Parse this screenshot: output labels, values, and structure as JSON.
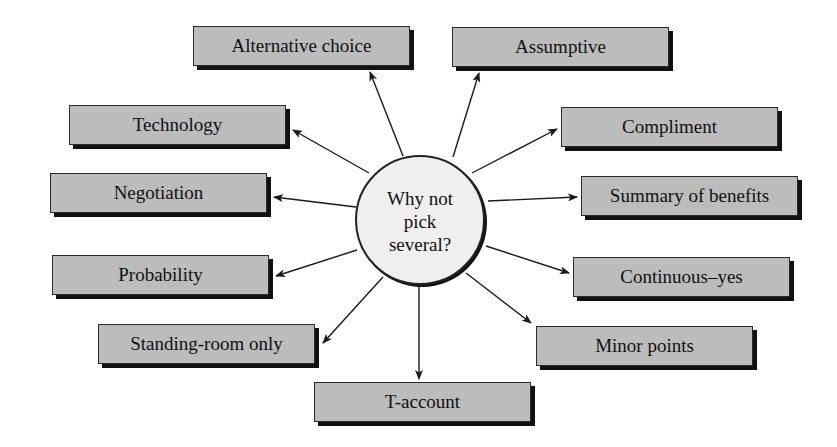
{
  "hub": {
    "label": "Why not\npick\nseveral?"
  },
  "nodes": [
    {
      "id": "alternative-choice",
      "label": "Alternative choice",
      "x": 193,
      "y": 26
    },
    {
      "id": "assumptive",
      "label": "Assumptive",
      "x": 452,
      "y": 27
    },
    {
      "id": "technology",
      "label": "Technology",
      "x": 69,
      "y": 105
    },
    {
      "id": "compliment",
      "label": "Compliment",
      "x": 561,
      "y": 107
    },
    {
      "id": "negotiation",
      "label": "Negotiation",
      "x": 50,
      "y": 173
    },
    {
      "id": "summary-of-benefits",
      "label": "Summary of benefits",
      "x": 581,
      "y": 176
    },
    {
      "id": "probability",
      "label": "Probability",
      "x": 52,
      "y": 255
    },
    {
      "id": "continuous-yes",
      "label": "Continuous–yes",
      "x": 573,
      "y": 257
    },
    {
      "id": "standing-room-only",
      "label": "Standing-room only",
      "x": 98,
      "y": 324
    },
    {
      "id": "minor-points",
      "label": "Minor points",
      "x": 536,
      "y": 326
    },
    {
      "id": "t-account",
      "label": "T-account",
      "x": 314,
      "y": 382
    }
  ],
  "arrows": [
    {
      "to": "alternative-choice",
      "x1": 403,
      "y1": 156,
      "x2": 370,
      "y2": 72
    },
    {
      "to": "assumptive",
      "x1": 453,
      "y1": 157,
      "x2": 479,
      "y2": 73
    },
    {
      "to": "technology",
      "x1": 369,
      "y1": 173,
      "x2": 293,
      "y2": 130
    },
    {
      "to": "compliment",
      "x1": 472,
      "y1": 173,
      "x2": 557,
      "y2": 129
    },
    {
      "to": "negotiation",
      "x1": 356,
      "y1": 207,
      "x2": 274,
      "y2": 197
    },
    {
      "to": "summary-of-benefits",
      "x1": 488,
      "y1": 201,
      "x2": 577,
      "y2": 197
    },
    {
      "to": "probability",
      "x1": 357,
      "y1": 250,
      "x2": 276,
      "y2": 276
    },
    {
      "to": "continuous-yes",
      "x1": 486,
      "y1": 246,
      "x2": 569,
      "y2": 273
    },
    {
      "to": "standing-room-only",
      "x1": 383,
      "y1": 277,
      "x2": 323,
      "y2": 343
    },
    {
      "to": "minor-points",
      "x1": 466,
      "y1": 273,
      "x2": 531,
      "y2": 323
    },
    {
      "to": "t-account",
      "x1": 419,
      "y1": 287,
      "x2": 419,
      "y2": 379
    }
  ],
  "colors": {
    "node_fill": "#bcbcbc",
    "node_shadow": "#111111",
    "hub_fill": "#efefef",
    "line": "#1a1a1a"
  }
}
